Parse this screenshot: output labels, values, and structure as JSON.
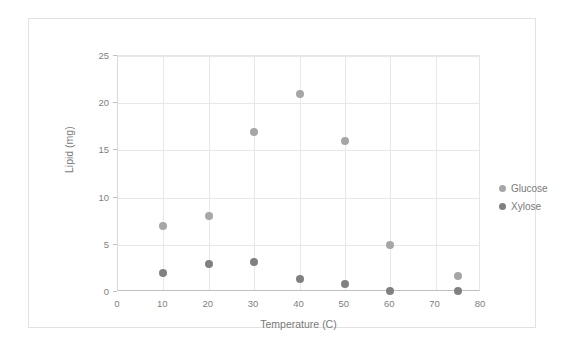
{
  "chart_data": {
    "type": "scatter",
    "title": "",
    "xlabel": "Temperature (C)",
    "ylabel": "Lipid (mg)",
    "xlim": [
      0,
      80
    ],
    "ylim": [
      0,
      25
    ],
    "xticks": [
      0,
      10,
      20,
      30,
      40,
      50,
      60,
      70,
      80
    ],
    "yticks": [
      0,
      5,
      10,
      15,
      20,
      25
    ],
    "grid": true,
    "legend_position": "right",
    "series": [
      {
        "name": "Glucose",
        "color": "#a6a6a6",
        "x": [
          10,
          20,
          30,
          40,
          50,
          60,
          75
        ],
        "y": [
          7,
          8,
          17,
          21,
          16,
          5,
          1.7
        ]
      },
      {
        "name": "Xylose",
        "color": "#808080",
        "x": [
          10,
          20,
          30,
          40,
          50,
          60,
          75
        ],
        "y": [
          2,
          3,
          3.2,
          1.4,
          0.8,
          0.1,
          0.1
        ]
      }
    ]
  },
  "legend": {
    "items": [
      {
        "label": "Glucose",
        "color": "#a6a6a6"
      },
      {
        "label": "Xylose",
        "color": "#808080"
      }
    ]
  }
}
